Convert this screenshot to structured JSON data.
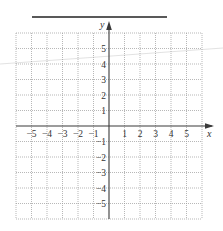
{
  "figure": {
    "type": "coordinate-grid",
    "answer_line": "",
    "x_axis_label": "x",
    "y_axis_label": "y",
    "x_ticks": [
      "-5",
      "-4",
      "-3",
      "-2",
      "-1",
      "1",
      "2",
      "3",
      "4",
      "5"
    ],
    "y_ticks": [
      "5",
      "4",
      "3",
      "2",
      "1",
      "-1",
      "-2",
      "-3",
      "-4",
      "-5"
    ],
    "x_range": [
      -6,
      6
    ],
    "y_range": [
      -6,
      6
    ],
    "grid": "dotted",
    "colors": {
      "axis": "#3a3a3a",
      "grid": "#9a9a9a",
      "answer_line": "#222222",
      "stray_line": "#c8c8c8"
    }
  }
}
